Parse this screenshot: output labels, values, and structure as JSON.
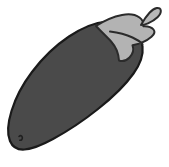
{
  "image": {
    "subject": "eggplant",
    "alt_text": "Line drawing of an eggplant with a calyx and stem",
    "style": "grayscale clip-art illustration",
    "background_color": "#ffffff",
    "width": 169,
    "height": 167
  },
  "parts": [
    {
      "id": "body",
      "label": "eggplant-body",
      "fill_color": "#4a4a4a",
      "outline_color": "#1a1a1a",
      "description": "large elongated teardrop body angled from lower-left to upper-right"
    },
    {
      "id": "calyx",
      "label": "eggplant-calyx",
      "fill_color": "#b3b3b3",
      "outline_color": "#2b2b2b",
      "description": "pointed star-shaped sepals capping the upper-right end"
    },
    {
      "id": "stem",
      "label": "eggplant-stem",
      "fill_color": "#b8b8b8",
      "outline_color": "#2b2b2b",
      "description": "short curved stalk pointing up and to the right"
    },
    {
      "id": "highlight",
      "label": "body-highlight-mark",
      "fill_color": "none",
      "outline_color": "#1f1f1f",
      "description": "small comma-shaped accent mark near the lower-left of the body"
    }
  ]
}
